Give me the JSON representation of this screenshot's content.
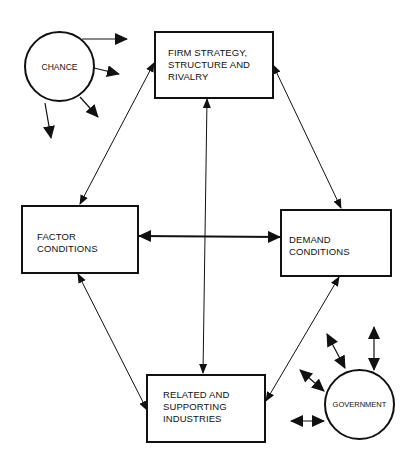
{
  "diagram": {
    "nodes": {
      "firm": {
        "label": "FIRM STRATEGY,\nSTRUCTURE AND\nRIVALRY"
      },
      "factor": {
        "label": "FACTOR CONDITIONS"
      },
      "demand": {
        "label": "DEMAND CONDITIONS"
      },
      "related": {
        "label": "RELATED AND\nSUPPORTING\nINDUSTRIES"
      },
      "chance": {
        "label": "CHANCE"
      },
      "government": {
        "label": "GOVERNMENT"
      }
    },
    "edges": [
      {
        "from": "firm",
        "to": "factor",
        "type": "bidirectional"
      },
      {
        "from": "firm",
        "to": "demand",
        "type": "bidirectional"
      },
      {
        "from": "firm",
        "to": "related",
        "type": "bidirectional"
      },
      {
        "from": "factor",
        "to": "demand",
        "type": "bidirectional"
      },
      {
        "from": "factor",
        "to": "related",
        "type": "bidirectional"
      },
      {
        "from": "demand",
        "to": "related",
        "type": "bidirectional"
      },
      {
        "from": "chance",
        "to": "outward",
        "type": "outgoing",
        "count": 4
      },
      {
        "from": "government",
        "to": "outward",
        "type": "bidirectional",
        "count": 4
      }
    ],
    "colors": {
      "stroke": "#111111",
      "background": "#ffffff"
    }
  }
}
